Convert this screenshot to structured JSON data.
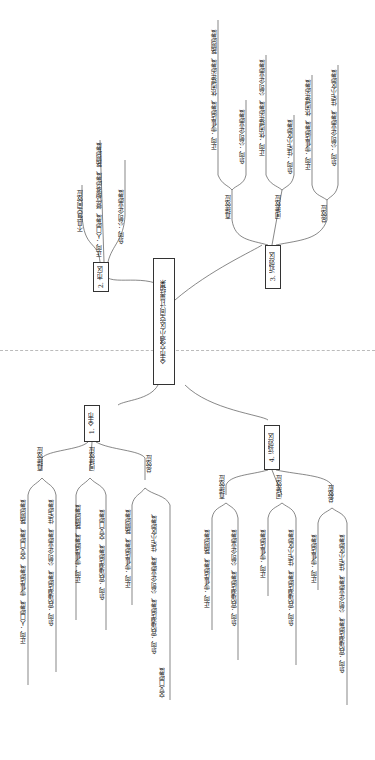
{
  "root": {
    "label": "全市交通小区空间计量结果"
  },
  "branches": {
    "city_center": {
      "label": "2. 市区",
      "items": {
        "none": "不具有空间效应",
        "pos": "正向：人口密度、餐饮服务密度、路网密度",
        "neg": "负向：公司企业密度"
      }
    },
    "near_suburb": {
      "label": "3. 近郊区",
      "direct": {
        "label": "直接效应",
        "pos": "正向：零售店密度、休闲娱乐密度、路网密度",
        "neg": "负向：公司企业密度"
      },
      "indirect": {
        "label": "间接效应",
        "pos": "正向：休闲娱乐密度、公司企业密度",
        "neg": "负向：住宅小区密度"
      },
      "total": {
        "label": "总效应",
        "pos": "正向：零售店密度、休闲娱乐密度",
        "neg": "负向：公司企业密度、住宅小区密度"
      }
    },
    "whole_city": {
      "label": "1. 全市",
      "direct": {
        "label": "直接效应",
        "pos": "正向：人口密度、零售店密度、交叉口密度、路网密度",
        "neg": "负向：宾馆酒店密度、公司企业密度、住宅密度"
      },
      "indirect": {
        "label": "间接效应",
        "pos": "正向：零售店密度、路网密度",
        "neg": "负向：宾馆酒店密度、交叉口密度"
      },
      "total": {
        "label": "总效应",
        "pos": "正向：零售店密度、路网密度",
        "neg": "负向：宾馆酒店密度、公司企业密度、住宅小区密度、",
        "neg2": "交叉口密度"
      }
    },
    "far_suburb": {
      "label": "4. 远郊区",
      "direct": {
        "label": "直接效应",
        "pos": "正向：零售店密度、路网密度",
        "neg": "负向：宾馆酒店密度、公司企业密度"
      },
      "indirect": {
        "label": "间接效应",
        "pos": "正向：零售店密度",
        "neg": "负向：宾馆酒店密度、住宅小区密度"
      },
      "total": {
        "label": "总效应",
        "pos": "正向：零售店密度",
        "neg": "负向：宾馆酒店密度、公司企业密度、住宅小区密度"
      }
    }
  },
  "colors": {
    "line": "#555555",
    "divider": "#bbbbbb"
  }
}
